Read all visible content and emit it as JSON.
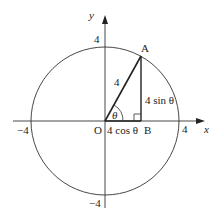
{
  "diagram": {
    "axes": {
      "x_label": "x",
      "y_label": "y",
      "ticks": {
        "x_pos": "4",
        "x_neg": "−4",
        "y_pos": "4",
        "y_neg": "−4"
      }
    },
    "circle": {
      "radius_value": 4
    },
    "points": {
      "origin": "O",
      "A": "A",
      "B": "B"
    },
    "labels": {
      "hypotenuse": "4",
      "adjacent": "4 cos θ",
      "opposite": "4 sin θ",
      "angle": "θ"
    },
    "colors": {
      "line": "#222222",
      "background": "#ffffff"
    }
  }
}
